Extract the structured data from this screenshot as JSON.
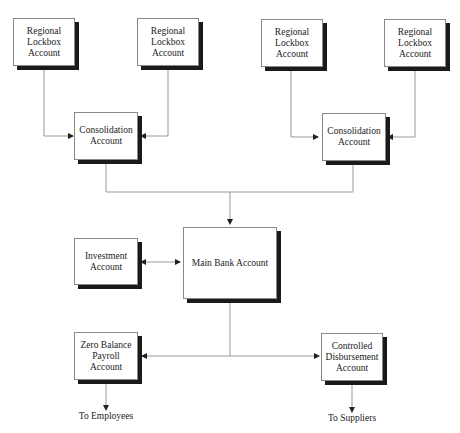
{
  "diagram": {
    "lockbox_1": "Regional\nLockbox\nAccount",
    "lockbox_2": "Regional\nLockbox\nAccount",
    "lockbox_3": "Regional\nLockbox\nAccount",
    "lockbox_4": "Regional\nLockbox\nAccount",
    "consolidation_left": "Consolidation\nAccount",
    "consolidation_right": "Consolidation\nAccount",
    "investment": "Investment\nAccount",
    "main_bank": "Main Bank Account",
    "zero_balance": "Zero Balance\nPayroll Account",
    "controlled_disbursement": "Controlled\nDisbursement\nAccount",
    "to_employees": "To Employees",
    "to_suppliers": "To Suppliers"
  }
}
